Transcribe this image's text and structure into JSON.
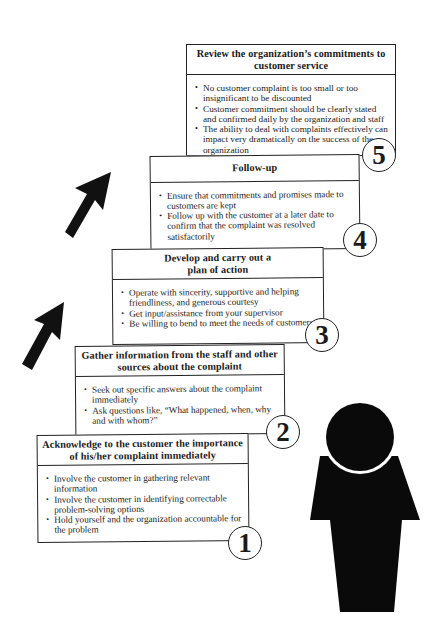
{
  "steps": [
    {
      "number": "1",
      "title": "Acknowledge to the customer the importance of his/her complaint immediately",
      "bullets": [
        "Involve the customer in gathering relevant information",
        "Involve the customer in identifying correctable problem-solving options",
        "Hold yourself and the organization accountable for the problem"
      ]
    },
    {
      "number": "2",
      "title": "Gather information from the staff and other sources about the complaint",
      "bullets": [
        "Seek out specific answers about the complaint immediately",
        "Ask questions like, “What happened, when, why and with whom?”"
      ]
    },
    {
      "number": "3",
      "title": "Develop and carry out a plan of action",
      "bullets": [
        "Operate with sincerity, supportive and helping friendliness, and generous courtesy",
        "Get input/assistance from your supervisor",
        "Be willing to bend to meet the needs of customers"
      ]
    },
    {
      "number": "4",
      "title": "Follow-up",
      "bullets": [
        "Ensure that commitments and promises made to customers are kept",
        "Follow up with the customer at a later date to confirm that the complaint was resolved satisfactorily"
      ]
    },
    {
      "number": "5",
      "title": "Review the organization’s commitments to customer service",
      "bullets": [
        "No customer complaint is too small or too insignificant to be discounted",
        "Customer commitment should be clearly stated and confirmed daily by the organization and staff",
        "The ability to deal with complaints effectively can impact very dramatically on the success of the organization"
      ]
    }
  ],
  "icons": {
    "arrows": [
      "up-right-arrow-icon",
      "up-right-arrow-icon"
    ],
    "person": "person-silhouette-icon"
  },
  "colors": {
    "ink": "#1a1a1a",
    "paper": "#ffffff"
  }
}
